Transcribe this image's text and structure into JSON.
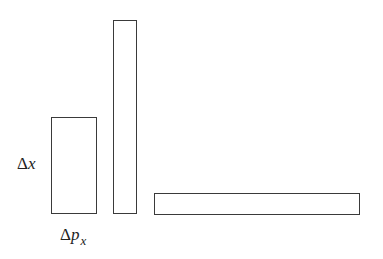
{
  "diagram": {
    "labels": {
      "delta_x": {
        "symbol": "Δ",
        "var": "x"
      },
      "delta_px": {
        "symbol": "Δ",
        "var": "p",
        "subscript": "x"
      }
    },
    "rectangles": [
      {
        "name": "square-ish-cell",
        "x": 51,
        "y": 117,
        "w": 46,
        "h": 97
      },
      {
        "name": "tall-narrow-cell",
        "x": 113,
        "y": 20,
        "w": 24,
        "h": 194
      },
      {
        "name": "wide-flat-cell",
        "x": 154,
        "y": 193,
        "w": 206,
        "h": 22
      }
    ],
    "stroke_color": "#3a3a3a"
  }
}
